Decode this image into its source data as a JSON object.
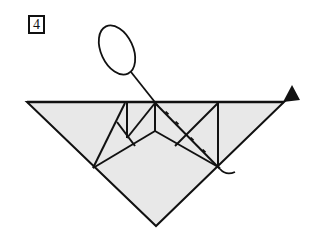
{
  "diagram": {
    "type": "origami-fold-instruction",
    "step_number": "4",
    "colors": {
      "paper_fill": "#e8e8e8",
      "line": "#111111",
      "background": "#ffffff"
    },
    "elements": [
      {
        "name": "paper-triangle",
        "description": "Large inverted triangle of folded paper with grey fill"
      },
      {
        "name": "crease-lines",
        "description": "Inner fold lines forming pocket/flap structure"
      },
      {
        "name": "valley-fold-line",
        "description": "Dashed/dotted diagonal fold line from top-center to lower right"
      },
      {
        "name": "fold-arrow",
        "description": "Looping arrow starting from lower right vertex, passing up to an open loop above the paper"
      },
      {
        "name": "arrowhead",
        "description": "Solid black arrowhead at the top right corner"
      }
    ]
  }
}
